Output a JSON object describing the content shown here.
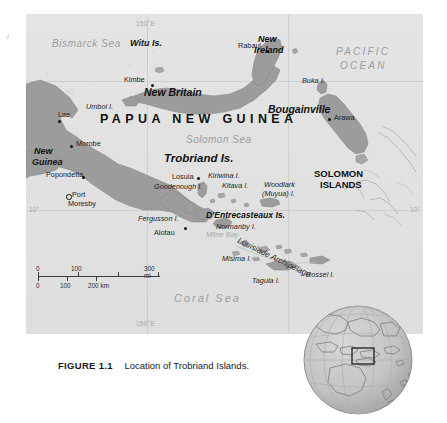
{
  "figure": {
    "number": "FIGURE 1.1",
    "caption": "Location of Trobriand Islands."
  },
  "margin_mark": "i",
  "map": {
    "country_label": "PAPUA NEW GUINEA",
    "seas": [
      {
        "name": "Bismarck Sea"
      },
      {
        "name": "Solomon Sea"
      },
      {
        "name": "Coral Sea"
      },
      {
        "name": "PACIFIC OCEAN"
      },
      {
        "name": "Milne Bay"
      }
    ],
    "sea_bismarck": "Bismarck Sea",
    "sea_solomon": "Solomon Sea",
    "sea_coral": "Coral Sea",
    "ocean_pacific_line1": "PACIFIC",
    "ocean_pacific_line2": "OCEAN",
    "bay_milne": "Milne Bay",
    "regions": {
      "solomon_islands_line1": "SOLOMON",
      "solomon_islands_line2": "ISLANDS",
      "new_guinea_line1": "New",
      "new_guinea_line2": "Guinea",
      "new_ireland_line1": "New",
      "new_ireland_line2": "Ireland"
    },
    "islands_major": {
      "witu": "Witu Is.",
      "new_britain": "New Britain",
      "bougainville": "Bougainville",
      "trobriand": "Trobriand Is.",
      "dentrecasteaux": "D'Entrecasteaux Is."
    },
    "islands_minor": [
      {
        "name": "Buka I."
      },
      {
        "name": "Umboi I."
      },
      {
        "name": "Kiriwina I."
      },
      {
        "name": "Kitava I."
      },
      {
        "name": "Woodlark"
      },
      {
        "name": "(Muyua) I."
      },
      {
        "name": "Goodenough I."
      },
      {
        "name": "Fergusson I."
      },
      {
        "name": "Normanby I."
      },
      {
        "name": "Misima I."
      },
      {
        "name": "Tagula I."
      },
      {
        "name": "Rossel I."
      }
    ],
    "isl_buka": "Buka I.",
    "isl_umboi": "Umboi I.",
    "isl_kiriwina": "Kiriwina I.",
    "isl_kitava": "Kitava I.",
    "isl_woodlark1": "Woodlark",
    "isl_woodlark2": "(Muyua) I.",
    "isl_goodenough": "Goodenough I.",
    "isl_fergusson": "Fergusson I.",
    "isl_normanby": "Normanby I.",
    "isl_misima": "Misima I.",
    "isl_tagula": "Tagula I.",
    "isl_rossel": "Rossel I.",
    "archipelago_louisiade": "Louisiade Archipelago",
    "cities": [
      {
        "name": "Rabaul"
      },
      {
        "name": "Kimbe"
      },
      {
        "name": "Arawa"
      },
      {
        "name": "Lae"
      },
      {
        "name": "Morobe"
      },
      {
        "name": "Popondetta"
      },
      {
        "name": "Port Moresby"
      },
      {
        "name": "Losuia"
      },
      {
        "name": "Alotau"
      }
    ],
    "city_rabaul": "Rabaul",
    "city_kimbe": "Kimbe",
    "city_arawa": "Arawa",
    "city_lae": "Lae",
    "city_morobe": "Morobe",
    "city_popondetta": "Popondetta",
    "city_port": "Port",
    "city_moresby": "Moresby",
    "city_losuia": "Losuia",
    "city_alotau": "Alotau",
    "coordinates": {
      "lon_top": "150°E",
      "lon_bottom": "150°E",
      "lat_left": "10°",
      "lat_right": "10°"
    },
    "scale": {
      "miles_unit": "mi",
      "km_unit": "km",
      "miles_ticks": [
        "0",
        "100",
        "300 mi"
      ],
      "km_ticks": [
        "0",
        "100",
        "200 km"
      ]
    },
    "colors": {
      "sea": "#e2e2e2",
      "land": "#9c9c9c",
      "graticule": "#cfcfcf",
      "label_sea": "#9d9d9d",
      "label_land": "#1b1b1b"
    }
  }
}
